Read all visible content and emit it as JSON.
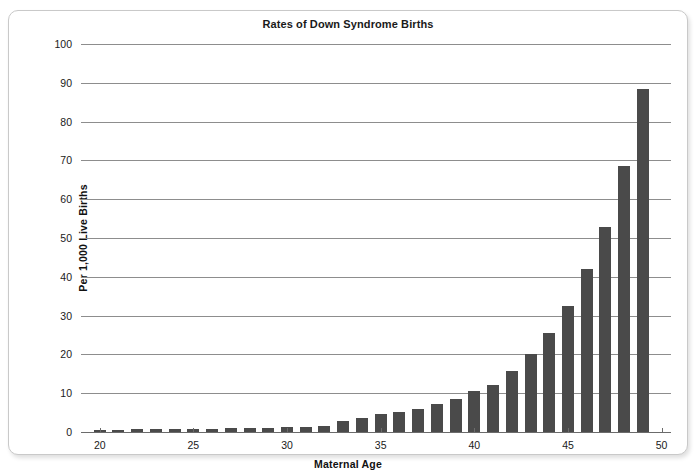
{
  "chart_data": {
    "type": "bar",
    "title": "Rates of Down Syndrome Births",
    "xlabel": "Maternal Age",
    "ylabel": "Per 1,000 Live Births",
    "xlim": [
      19,
      50.5
    ],
    "ylim": [
      0,
      100
    ],
    "ytick_labels": [
      "0",
      "10",
      "20",
      "30",
      "40",
      "50",
      "60",
      "70",
      "80",
      "90",
      "100"
    ],
    "yticks": [
      0,
      10,
      20,
      30,
      40,
      50,
      60,
      70,
      80,
      90,
      100
    ],
    "xtick_labels": [
      "20",
      "25",
      "30",
      "35",
      "40",
      "45",
      "50"
    ],
    "xticks": [
      20,
      25,
      30,
      35,
      40,
      45,
      50
    ],
    "grid": true,
    "legend": "none",
    "bar_color": "#4a4a4a",
    "categories": [
      20,
      21,
      22,
      23,
      24,
      25,
      26,
      27,
      28,
      29,
      30,
      31,
      32,
      33,
      34,
      35,
      36,
      37,
      38,
      39,
      40,
      41,
      42,
      43,
      44,
      45,
      46,
      47,
      48,
      49
    ],
    "values": [
      0.6,
      0.6,
      0.7,
      0.7,
      0.8,
      0.9,
      0.9,
      1.0,
      1.0,
      1.1,
      1.2,
      1.4,
      1.6,
      2.8,
      3.6,
      4.7,
      5.2,
      6.0,
      7.1,
      8.4,
      10.5,
      12.1,
      15.6,
      20.2,
      25.5,
      32.4,
      42.0,
      52.9,
      68.5,
      88.3
    ]
  }
}
